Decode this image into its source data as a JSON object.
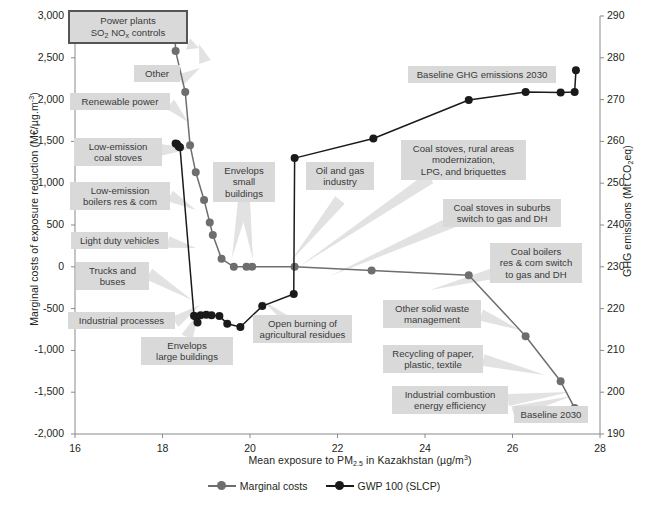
{
  "chart_data": {
    "type": "line",
    "title": "",
    "xlabel": "Mean exposure to PM2.5 in Kazakhstan (µg/m³)",
    "ylabel": "Marginal costs of exposure reduction (M€/µg.m⁻³)",
    "y2label": "GHG emissions (Mt CO2eq)",
    "xlim": [
      16,
      28
    ],
    "ylim": [
      -2000,
      3000
    ],
    "y2lim": [
      190,
      290
    ],
    "grid": false,
    "legend_position": "bottom",
    "xticks": [
      "16",
      "18",
      "20",
      "22",
      "24",
      "26",
      "28"
    ],
    "yticks": [
      "3,000",
      "2,500",
      "2,000",
      "1,500",
      "1,000",
      "500",
      "0",
      "-500",
      "-1,000",
      "-1,500",
      "-2,000"
    ],
    "y2ticks": [
      "290",
      "280",
      "270",
      "260",
      "250",
      "240",
      "230",
      "220",
      "210",
      "200",
      "190"
    ],
    "series": [
      {
        "name": "Marginal costs",
        "axis": "left",
        "color": "#6e6e6e",
        "points": [
          [
            18.27,
            3000
          ],
          [
            18.3,
            2580
          ],
          [
            18.52,
            2090
          ],
          [
            18.63,
            1455
          ],
          [
            18.76,
            1130
          ],
          [
            18.95,
            800
          ],
          [
            19.08,
            530
          ],
          [
            19.15,
            380
          ],
          [
            19.35,
            95
          ],
          [
            19.63,
            0
          ],
          [
            19.92,
            0
          ],
          [
            20.05,
            0
          ],
          [
            21.02,
            0
          ],
          [
            22.78,
            -45
          ],
          [
            25.0,
            -100
          ],
          [
            26.3,
            -830
          ],
          [
            27.1,
            -1370
          ],
          [
            27.42,
            -1690
          ]
        ]
      },
      {
        "name": "GWP 100 (SLCP)",
        "axis": "right",
        "color": "#1a1a1a",
        "points": [
          [
            18.3,
            259.5
          ],
          [
            18.33,
            259.4
          ],
          [
            18.37,
            258.8
          ],
          [
            18.4,
            258.6
          ],
          [
            18.72,
            218.3
          ],
          [
            18.77,
            218.0
          ],
          [
            18.8,
            216.7
          ],
          [
            18.87,
            218.4
          ],
          [
            19.0,
            218.5
          ],
          [
            19.12,
            218.4
          ],
          [
            19.3,
            218.2
          ],
          [
            19.48,
            216.4
          ],
          [
            19.78,
            215.6
          ],
          [
            20.28,
            220.6
          ],
          [
            21.0,
            223.5
          ],
          [
            21.02,
            256.0
          ],
          [
            22.82,
            260.7
          ],
          [
            25.0,
            269.9
          ],
          [
            26.3,
            271.8
          ],
          [
            27.1,
            271.7
          ],
          [
            27.42,
            271.8
          ],
          [
            27.45,
            277.0
          ]
        ]
      }
    ],
    "annotations": [
      {
        "text": "Power plants\nSO2 NOx controls",
        "boxed": true
      },
      {
        "text": "Other",
        "boxed": false
      },
      {
        "text": "Renewable power",
        "boxed": false
      },
      {
        "text": "Low-emission\ncoal stoves",
        "boxed": false
      },
      {
        "text": "Low-emission\nboilers res & com",
        "boxed": false
      },
      {
        "text": "Light duty vehicles",
        "boxed": false
      },
      {
        "text": "Trucks and\nbuses",
        "boxed": false
      },
      {
        "text": "Industrial processes",
        "boxed": false
      },
      {
        "text": "Envelops\nsmall\nbuildings",
        "boxed": false
      },
      {
        "text": "Envelops\nlarge buildings",
        "boxed": false
      },
      {
        "text": "Open burning of\nagricultural residues",
        "boxed": false
      },
      {
        "text": "Oil and gas\nindustry",
        "boxed": false
      },
      {
        "text": "Coal stoves, rural areas\nmodernization,\nLPG, and briquettes",
        "boxed": false
      },
      {
        "text": "Baseline GHG emissions 2030",
        "boxed": false
      },
      {
        "text": "Coal stoves in suburbs\nswitch to gas and DH",
        "boxed": false
      },
      {
        "text": "Coal boilers\nres & com switch\nto gas and DH",
        "boxed": false
      },
      {
        "text": "Other solid waste\nmanagement",
        "boxed": false
      },
      {
        "text": "Recycling of paper,\nplastic, textile",
        "boxed": false
      },
      {
        "text": "Industrial combustion\nenergy efficiency",
        "boxed": false
      },
      {
        "text": "Baseline 2030",
        "boxed": false
      }
    ]
  },
  "axes": {
    "left_title_pre": "Marginal costs of exposure reduction (M€/µg.m",
    "left_title_sup": "-3",
    "left_title_post": ")",
    "right_title_pre": "GHG emissions (Mt CO",
    "right_title_sub": "2",
    "right_title_post": "eq)",
    "x_title_pre": "Mean exposure to PM",
    "x_title_sub": "2.5",
    "x_title_post": " in Kazakhstan (µg/m",
    "x_title_sup": "3",
    "x_title_end": ")"
  },
  "labels": {
    "power_plants_l1": "Power plants",
    "power_plants_l2_pre": "SO",
    "power_plants_l2_sub1": "2",
    "power_plants_l2_mid": " NO",
    "power_plants_l2_sub2": "x",
    "power_plants_l2_post": " controls",
    "other": "Other",
    "renewable_power": "Renewable power",
    "low_emission_coal_stoves": "Low-emission\ncoal stoves",
    "low_emission_boilers": "Low-emission\nboilers res & com",
    "light_duty_vehicles": "Light duty vehicles",
    "trucks_and_buses": "Trucks and\nbuses",
    "industrial_processes": "Industrial processes",
    "envelops_small_buildings": "Envelops\nsmall\nbuildings",
    "envelops_large_buildings": "Envelops\nlarge buildings",
    "open_burning": "Open burning of\nagricultural residues",
    "oil_and_gas": "Oil and gas\nindustry",
    "coal_stoves_rural": "Coal stoves, rural areas\nmodernization,\nLPG, and briquettes",
    "baseline_ghg_2030": "Baseline GHG emissions 2030",
    "coal_stoves_suburbs": "Coal stoves in suburbs\nswitch to gas and DH",
    "coal_boilers": "Coal boilers\nres & com switch\nto gas and DH",
    "other_solid_waste": "Other solid waste\nmanagement",
    "recycling": "Recycling of paper,\nplastic, textile",
    "industrial_combustion": "Industrial combustion\nenergy efficiency",
    "baseline_2030": "Baseline 2030"
  },
  "legend": {
    "items": [
      {
        "label": "Marginal costs",
        "color": "#6e6e6e"
      },
      {
        "label": "GWP 100 (SLCP)",
        "color": "#1a1a1a"
      }
    ]
  },
  "colors": {
    "marginal_costs": "#6e6e6e",
    "gwp100": "#1a1a1a",
    "label_bg": "#d9d9d9",
    "leader": "#e2e2e2",
    "axis": "#8a8a8a"
  }
}
